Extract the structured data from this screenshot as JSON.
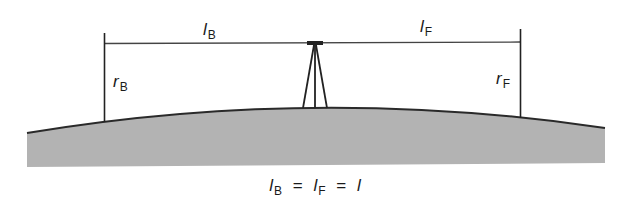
{
  "diagram": {
    "type": "leveling-sight-distances",
    "colors": {
      "ground_fill": "#b3b3b3",
      "ground_edge": "#2a2a2a",
      "lines": "#222222",
      "text": "#1a1a1a"
    },
    "labels": {
      "back_distance": {
        "symbol": "l",
        "subscript": "B"
      },
      "fore_distance": {
        "symbol": "l",
        "subscript": "F"
      },
      "back_reading": {
        "symbol": "r",
        "subscript": "B"
      },
      "fore_reading": {
        "symbol": "r",
        "subscript": "F"
      }
    },
    "formula": {
      "term1": {
        "symbol": "l",
        "subscript": "B"
      },
      "eq1": "=",
      "term2": {
        "symbol": "l",
        "subscript": "F"
      },
      "eq2": "=",
      "term3": {
        "symbol": "l"
      }
    },
    "elements": [
      "back staff",
      "level instrument on tripod",
      "fore staff",
      "curved ground surface"
    ]
  }
}
